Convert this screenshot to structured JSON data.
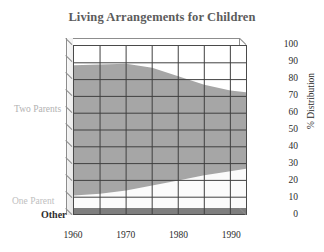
{
  "chart_data": {
    "type": "area",
    "title": "Living Arrangements for Children",
    "xlabel": "",
    "ylabel": "% Distribution",
    "stacked": true,
    "grid": true,
    "legend_position": "inline-left",
    "xlim": [
      1960,
      1993
    ],
    "ylim": [
      0,
      100
    ],
    "yticks": [
      0,
      10,
      20,
      30,
      40,
      50,
      60,
      70,
      80,
      90,
      100
    ],
    "xticks": [
      1960,
      1970,
      1980,
      1990
    ],
    "x": [
      1960,
      1965,
      1970,
      1975,
      1980,
      1985,
      1990,
      1993
    ],
    "series": [
      {
        "name": "Other",
        "color": "#7e7e7e",
        "values": [
          3.5,
          3.5,
          3.5,
          3.5,
          3.5,
          3.5,
          3.5,
          3.5
        ]
      },
      {
        "name": "One Parent",
        "color": "#fbfbfb",
        "values": [
          7.5,
          8.5,
          10.5,
          13.5,
          16.5,
          19.5,
          22.0,
          23.5
        ]
      },
      {
        "name": "Two Parents",
        "color": "#a6a6a6",
        "values": [
          77.5,
          77.0,
          75.5,
          70.0,
          62.0,
          54.0,
          48.0,
          45.5
        ]
      }
    ],
    "stack_top": [
      88.5,
      89.0,
      89.5,
      87.0,
      82.0,
      77.0,
      73.5,
      72.5
    ],
    "colors": {
      "two_parents": "#a6a6a6",
      "one_parent": "#fbfbfb",
      "other": "#7e7e7e",
      "title": "#5c5c5c",
      "axis_text": "#2b2b2b",
      "grid": "#3f3f3f",
      "frame_back": "#8d8d8d",
      "plot_bg": "#ffffff",
      "label_muted": "#b8b8b8"
    }
  },
  "title": {
    "text": "Living Arrangements for Children"
  },
  "axes": {
    "y_title": "% Distribution",
    "y_ticks": [
      "100",
      "90",
      "80",
      "70",
      "60",
      "50",
      "40",
      "30",
      "20",
      "10",
      "0"
    ],
    "x_ticks": [
      "1960",
      "1970",
      "1980",
      "1990"
    ]
  },
  "series_labels": {
    "two_parents": "Two Parents",
    "one_parent": "One Parent",
    "other": "Other"
  }
}
